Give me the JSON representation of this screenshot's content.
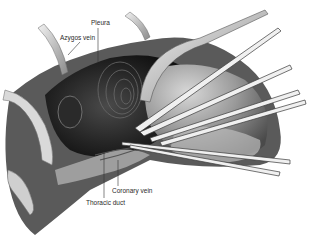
{
  "figure": {
    "labels": [
      {
        "id": "pleura",
        "text": "Pleura",
        "x": 91,
        "y": 20,
        "line": {
          "x1": 98,
          "y1": 28,
          "x2": 98,
          "y2": 62
        }
      },
      {
        "id": "azygos-vein",
        "text": "Azygos vein",
        "x": 60,
        "y": 35,
        "line": {
          "x1": 80,
          "y1": 42,
          "x2": 68,
          "y2": 55
        }
      },
      {
        "id": "coronary-vein",
        "text": "Coronary vein",
        "x": 112,
        "y": 188,
        "line": {
          "x1": 118,
          "y1": 186,
          "x2": 118,
          "y2": 162
        }
      },
      {
        "id": "thoracic-duct",
        "text": "Thoracic duct",
        "x": 86,
        "y": 200,
        "line": {
          "x1": 104,
          "y1": 198,
          "x2": 104,
          "y2": 152
        }
      }
    ],
    "colors": {
      "background": "#ffffff",
      "cavity": "#1e1e1e",
      "tissue_dark": "#3a3a3a",
      "tissue_mid": "#7a7a7a",
      "tissue_light": "#c8c8c8",
      "instrument": "#e6e6e6",
      "label_text": "#2a2a2a"
    }
  }
}
